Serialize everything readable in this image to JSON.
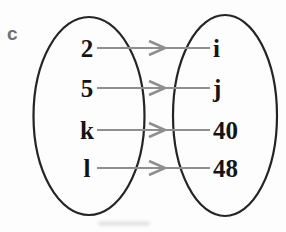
{
  "diagram": {
    "part_label": "c",
    "kind": "set-mapping-diagram",
    "left_set": {
      "elements": [
        "2",
        "5",
        "k",
        "l"
      ]
    },
    "right_set": {
      "elements": [
        "i",
        "j",
        "40",
        "48"
      ]
    },
    "mappings": [
      {
        "from": "2",
        "to": "i"
      },
      {
        "from": "5",
        "to": "j"
      },
      {
        "from": "k",
        "to": "40"
      },
      {
        "from": "l",
        "to": "48"
      }
    ],
    "colors": {
      "arrow": "#8f8f8f",
      "oval_stroke": "#242424",
      "element_text": "#141414",
      "part_label": "#6f6f6f",
      "background": "#fdfdfd"
    }
  }
}
